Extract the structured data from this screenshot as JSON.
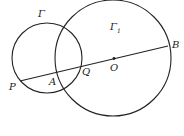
{
  "diagram": {
    "circles": [
      {
        "name": "Gamma",
        "label": "Γ",
        "cx": 47,
        "cy": 58,
        "r": 35
      },
      {
        "name": "Gamma1",
        "label": "Γ",
        "subscript": "1",
        "cx": 113,
        "cy": 58,
        "r": 58
      }
    ],
    "segment": {
      "from": "P",
      "to": "B",
      "x1": 20,
      "y1": 81,
      "x2": 168,
      "y2": 46
    },
    "points": [
      {
        "label": "P",
        "x": 20,
        "y": 81
      },
      {
        "label": "A",
        "x": 58,
        "y": 72
      },
      {
        "label": "Q",
        "x": 82,
        "y": 66
      },
      {
        "label": "O",
        "x": 114,
        "y": 59
      },
      {
        "label": "B",
        "x": 168,
        "y": 46
      }
    ],
    "labels": {
      "gamma": "Γ",
      "gamma1": "Γ",
      "gamma1_sub": "1",
      "P": "P",
      "A": "A",
      "Q": "Q",
      "O": "O",
      "B": "B"
    },
    "stroke_color": "#222222"
  }
}
